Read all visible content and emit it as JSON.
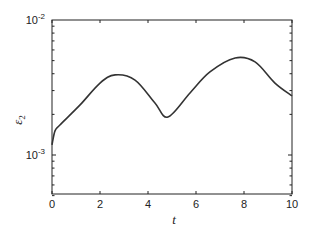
{
  "chart_data": {
    "type": "line",
    "title": "",
    "xlabel": "t",
    "ylabel": "ε₂",
    "xlim": [
      0,
      10
    ],
    "ylim": [
      0.0005,
      0.01
    ],
    "yscale": "log",
    "grid": false,
    "legend": null,
    "x_ticks": [
      0,
      2,
      4,
      6,
      8,
      10
    ],
    "x_tick_labels": [
      "0",
      "2",
      "4",
      "6",
      "8",
      "10"
    ],
    "y_ticks": [
      0.001,
      0.01
    ],
    "y_tick_labels": [
      {
        "base": "10",
        "exp": "-3"
      },
      {
        "base": "10",
        "exp": "-2"
      }
    ],
    "series": [
      {
        "name": "ε2",
        "color": "#333333",
        "x": [
          0,
          0.125,
          0.33,
          1.17,
          2.0,
          2.63,
          3.46,
          4.29,
          4.83,
          5.75,
          6.58,
          7.63,
          8.46,
          9.29,
          10
        ],
        "values": [
          0.00119,
          0.00151,
          0.00167,
          0.00235,
          0.00341,
          0.00392,
          0.00359,
          0.00243,
          0.00191,
          0.00288,
          0.00412,
          0.00523,
          0.00489,
          0.00341,
          0.00274
        ]
      }
    ]
  }
}
